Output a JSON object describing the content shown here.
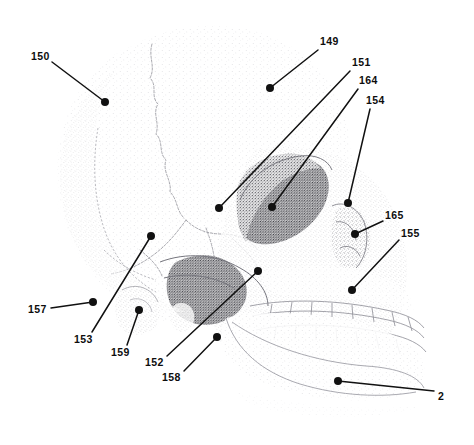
{
  "figure": {
    "type": "anatomical-illustration",
    "rendering_style": "stippled halftone line drawing",
    "background_color": "#ffffff",
    "ink_color": "#111111",
    "width": 474,
    "height": 445,
    "callouts": [
      {
        "id": "callout-150",
        "label": "150",
        "label_x": 31,
        "label_y": 51,
        "line_x1": 52,
        "line_y1": 62,
        "dot_x": 105,
        "dot_y": 102
      },
      {
        "id": "callout-149",
        "label": "149",
        "label_x": 320,
        "label_y": 36,
        "line_x1": 318,
        "line_y1": 50,
        "dot_x": 270,
        "dot_y": 88
      },
      {
        "id": "callout-151",
        "label": "151",
        "label_x": 352,
        "label_y": 57,
        "line_x1": 350,
        "line_y1": 71,
        "dot_x": 219,
        "dot_y": 208
      },
      {
        "id": "callout-164",
        "label": "164",
        "label_x": 359,
        "label_y": 75,
        "line_x1": 358,
        "line_y1": 89,
        "dot_x": 272,
        "dot_y": 207
      },
      {
        "id": "callout-154",
        "label": "154",
        "label_x": 366,
        "label_y": 95,
        "line_x1": 370,
        "line_y1": 109,
        "dot_x": 348,
        "dot_y": 203
      },
      {
        "id": "callout-165",
        "label": "165",
        "label_x": 385,
        "label_y": 210,
        "line_x1": 383,
        "line_y1": 221,
        "dot_x": 355,
        "dot_y": 234
      },
      {
        "id": "callout-155",
        "label": "155",
        "label_x": 401,
        "label_y": 228,
        "line_x1": 399,
        "line_y1": 240,
        "dot_x": 352,
        "dot_y": 290
      },
      {
        "id": "callout-2",
        "label": "2",
        "label_x": 438,
        "label_y": 391,
        "line_x1": 434,
        "line_y1": 391,
        "dot_x": 338,
        "dot_y": 381
      },
      {
        "id": "callout-157",
        "label": "157",
        "label_x": 28,
        "label_y": 304,
        "line_x1": 51,
        "line_y1": 308,
        "dot_x": 93,
        "dot_y": 302
      },
      {
        "id": "callout-153",
        "label": "153",
        "label_x": 74,
        "label_y": 334,
        "line_x1": 92,
        "line_y1": 332,
        "dot_x": 151,
        "dot_y": 236
      },
      {
        "id": "callout-159",
        "label": "159",
        "label_x": 111,
        "label_y": 347,
        "line_x1": 127,
        "line_y1": 345,
        "dot_x": 139,
        "dot_y": 310
      },
      {
        "id": "callout-152",
        "label": "152",
        "label_x": 145,
        "label_y": 357,
        "line_x1": 167,
        "line_y1": 356,
        "dot_x": 258,
        "dot_y": 271
      },
      {
        "id": "callout-158",
        "label": "158",
        "label_x": 162,
        "label_y": 372,
        "line_x1": 184,
        "line_y1": 371,
        "dot_x": 217,
        "dot_y": 337
      }
    ]
  }
}
